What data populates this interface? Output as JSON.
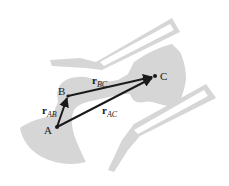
{
  "diagram": {
    "type": "position-vector-diagram",
    "points": [
      {
        "id": "A",
        "label": "A",
        "x": 57,
        "y": 127
      },
      {
        "id": "B",
        "label": "B",
        "x": 68,
        "y": 96
      },
      {
        "id": "C",
        "label": "C",
        "x": 155,
        "y": 76
      }
    ],
    "vectors": [
      {
        "id": "rAB",
        "symbol": "r",
        "subscript": "AB",
        "from": "A",
        "to": "B"
      },
      {
        "id": "rBC",
        "symbol": "r",
        "subscript": "BC",
        "from": "B",
        "to": "C"
      },
      {
        "id": "rAC",
        "symbol": "r",
        "subscript": "AC",
        "from": "A",
        "to": "C"
      }
    ],
    "colors": {
      "shape_fill": "#d6d6d6",
      "vector": "#1a1a1a",
      "background": "#ffffff"
    }
  }
}
